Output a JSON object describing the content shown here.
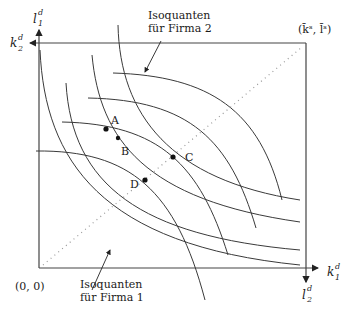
{
  "diagram": {
    "type": "Edgeworth box (production)",
    "origin_firm1_label": "(0, 0)",
    "origin_firm2_label": "(k̄ˢ, l̄ˢ)",
    "axes": {
      "firm1_vertical": {
        "base": "l",
        "sub": "1",
        "sup": "d"
      },
      "firm1_horizontal": {
        "base": "k",
        "sub": "1",
        "sup": "d"
      },
      "firm2_horizontal": {
        "base": "k",
        "sub": "2",
        "sup": "d"
      },
      "firm2_vertical": {
        "base": "l",
        "sub": "2",
        "sup": "d"
      }
    },
    "annotations": {
      "firm2": {
        "line1": "Isoquanten",
        "line2": "für Firma 2"
      },
      "firm1": {
        "line1": "Isoquanten",
        "line2": "für Firma 1"
      }
    },
    "points": [
      {
        "label": "A"
      },
      {
        "label": "B"
      },
      {
        "label": "C"
      },
      {
        "label": "D"
      }
    ],
    "contract_curve": "dotted diagonal from (0,0) to (k̄ˢ, l̄ˢ)",
    "colors": {
      "line": "#3a3a3a",
      "dots": "#999999",
      "text": "#1a1a1a"
    }
  }
}
